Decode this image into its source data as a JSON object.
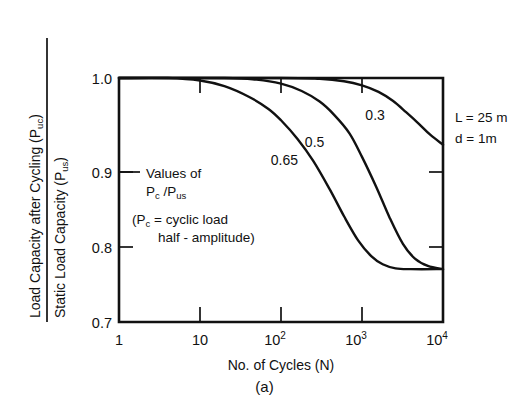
{
  "figure": {
    "caption": "(a)"
  },
  "axes": {
    "y_title_numerator": "Load Capacity after Cycling (P",
    "y_title_numerator_sub": "uc",
    "y_title_numerator_end": ")",
    "y_title_denominator": "Static Load Capacity (P",
    "y_title_denominator_sub": "us",
    "y_title_denominator_end": ")",
    "x_title": "No. of Cycles (N)",
    "y_ticks": [
      "1.0",
      "0.9",
      "0.8",
      "0.7"
    ],
    "x_tick_1": "1",
    "x_tick_10": "10",
    "x_tick_100_base": "10",
    "x_tick_100_exp": "2",
    "x_tick_1000_base": "10",
    "x_tick_1000_exp": "3",
    "x_tick_10000_base": "10",
    "x_tick_10000_exp": "4"
  },
  "annotations": {
    "values_line1": "Values  of",
    "values_line2_a": "P",
    "values_line2_a_sub": "c",
    "values_line2_b": " /P",
    "values_line2_b_sub": "us",
    "note_line1_a": "(P",
    "note_line1_a_sub": "c",
    "note_line1_b": " = cyclic  load",
    "note_line2": "half - amplitude)",
    "param_length": "L = 25 m",
    "param_diameter": "d = 1m"
  },
  "chart_data": {
    "type": "line",
    "title": "",
    "xlabel": "No. of Cycles (N)",
    "ylabel": "Load Capacity after Cycling (Puc) / Static Load Capacity (Pus)",
    "x_scale": "log",
    "xlim": [
      1,
      10000
    ],
    "ylim": [
      0.7,
      1.0
    ],
    "x_tick_values": [
      1,
      10,
      100,
      1000,
      10000
    ],
    "y_tick_values": [
      0.7,
      0.8,
      0.9,
      1.0
    ],
    "grid": false,
    "legend": "inline-curve-labels",
    "annotations": [
      "Values of Pc / Pus",
      "(Pc = cyclic load half - amplitude)",
      "L = 25 m",
      "d = 1m"
    ],
    "series": [
      {
        "name": "0.65",
        "label": "0.65",
        "label_x": 110,
        "label_y": 0.893,
        "points": [
          [
            1,
            1.0
          ],
          [
            4,
            1.0
          ],
          [
            10,
            0.997
          ],
          [
            20,
            0.99
          ],
          [
            40,
            0.977
          ],
          [
            70,
            0.962
          ],
          [
            100,
            0.948
          ],
          [
            160,
            0.925
          ],
          [
            250,
            0.898
          ],
          [
            400,
            0.863
          ],
          [
            600,
            0.83
          ],
          [
            900,
            0.8
          ],
          [
            1300,
            0.781
          ],
          [
            1800,
            0.771
          ],
          [
            2600,
            0.766
          ],
          [
            4000,
            0.765
          ],
          [
            10000,
            0.765
          ]
        ]
      },
      {
        "name": "0.5",
        "label": "0.5",
        "label_x": 260,
        "label_y": 0.915,
        "points": [
          [
            1,
            1.0
          ],
          [
            20,
            1.0
          ],
          [
            50,
            0.998
          ],
          [
            100,
            0.993
          ],
          [
            180,
            0.984
          ],
          [
            300,
            0.971
          ],
          [
            450,
            0.955
          ],
          [
            700,
            0.932
          ],
          [
            1000,
            0.903
          ],
          [
            1500,
            0.866
          ],
          [
            2200,
            0.828
          ],
          [
            3200,
            0.796
          ],
          [
            4500,
            0.778
          ],
          [
            6500,
            0.769
          ],
          [
            10000,
            0.765
          ]
        ]
      },
      {
        "name": "0.3",
        "label": "0.3",
        "label_x": 1450,
        "label_y": 0.948,
        "points": [
          [
            1,
            1.0
          ],
          [
            100,
            1.0
          ],
          [
            300,
            0.999
          ],
          [
            600,
            0.996
          ],
          [
            1000,
            0.991
          ],
          [
            1600,
            0.983
          ],
          [
            2400,
            0.972
          ],
          [
            3500,
            0.958
          ],
          [
            5000,
            0.944
          ],
          [
            7000,
            0.93
          ],
          [
            10000,
            0.918
          ]
        ]
      }
    ]
  }
}
